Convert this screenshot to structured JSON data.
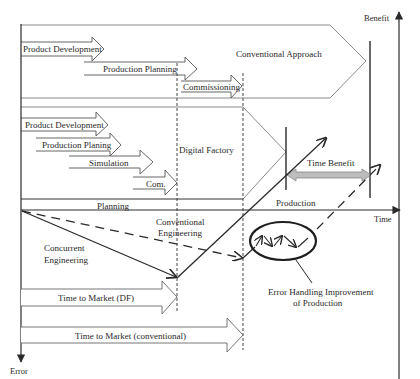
{
  "diagram": {
    "axes": {
      "benefit": "Benefit",
      "time": "Time",
      "error": "Error"
    },
    "conventional": {
      "label": "Conventional Approach",
      "steps": [
        "Product Development",
        "Production Planning",
        "Commissioning"
      ]
    },
    "digital_factory": {
      "label": "Digital Factory",
      "steps": [
        "Product Development",
        "Production Planing",
        "Simulation",
        "Com."
      ]
    },
    "phases": {
      "planning": "Planning",
      "production": "Production"
    },
    "time_benefit": "Time Benefit",
    "curves": {
      "concurrent": [
        "Concurrent",
        "Engineering"
      ],
      "conventional": [
        "Conventional",
        "Engineering"
      ]
    },
    "error_handling": [
      "Error Handling Improvement",
      "of  Production"
    ],
    "time_to_market": {
      "df": "Time to Market (DF)",
      "conventional": "Time to Market (conventional)"
    },
    "colors": {
      "line": "#2a2a2a",
      "outline": "#8a8a8a",
      "time_benefit_fill": "#bdbdbd"
    }
  }
}
